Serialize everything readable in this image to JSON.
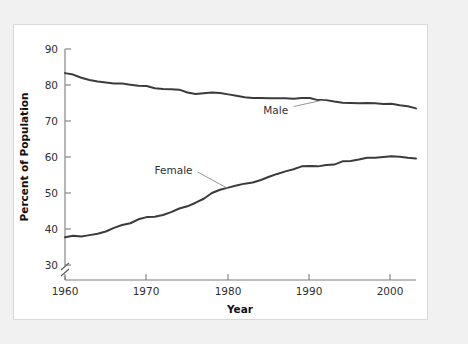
{
  "chart_data": {
    "type": "line",
    "title": "",
    "xlabel": "Year",
    "ylabel": "Percent of Population",
    "xlim": [
      1960,
      2003
    ],
    "ylim": [
      30,
      90
    ],
    "y_axis_break": true,
    "grid": false,
    "legend_position": "inline-annotation",
    "xticks": [
      1960,
      1970,
      1980,
      1990,
      2000
    ],
    "xtick_labels": [
      "1960",
      "1970",
      "1980",
      "1990",
      "2000"
    ],
    "yticks": [
      30,
      40,
      50,
      60,
      70,
      80,
      90
    ],
    "ytick_labels": [
      "30",
      "40",
      "50",
      "60",
      "70",
      "80",
      "90"
    ],
    "x": [
      1960,
      1961,
      1962,
      1963,
      1964,
      1965,
      1966,
      1967,
      1968,
      1969,
      1970,
      1971,
      1972,
      1973,
      1974,
      1975,
      1976,
      1977,
      1978,
      1979,
      1980,
      1981,
      1982,
      1983,
      1984,
      1985,
      1986,
      1987,
      1988,
      1989,
      1990,
      1991,
      1992,
      1993,
      1994,
      1995,
      1996,
      1997,
      1998,
      1999,
      2000,
      2001,
      2002,
      2003
    ],
    "series": [
      {
        "name": "Male",
        "label": "Male",
        "color": "#3b3b3b",
        "values": [
          83.3,
          82.9,
          82.0,
          81.4,
          81.0,
          80.7,
          80.4,
          80.4,
          80.1,
          79.8,
          79.7,
          79.1,
          78.9,
          78.8,
          78.7,
          77.9,
          77.5,
          77.7,
          77.9,
          77.8,
          77.4,
          77.0,
          76.6,
          76.4,
          76.4,
          76.3,
          76.3,
          76.3,
          76.2,
          76.4,
          76.4,
          75.8,
          75.8,
          75.4,
          75.1,
          75.0,
          74.9,
          75.0,
          74.9,
          74.7,
          74.8,
          74.4,
          74.1,
          73.5
        ]
      },
      {
        "name": "Female",
        "label": "Female",
        "color": "#3b3b3b",
        "values": [
          37.7,
          38.1,
          37.9,
          38.3,
          38.7,
          39.3,
          40.3,
          41.1,
          41.6,
          42.7,
          43.3,
          43.4,
          43.9,
          44.7,
          45.7,
          46.3,
          47.3,
          48.4,
          50.0,
          50.9,
          51.5,
          52.1,
          52.6,
          52.9,
          53.6,
          54.5,
          55.3,
          56.0,
          56.6,
          57.4,
          57.5,
          57.4,
          57.8,
          57.9,
          58.8,
          58.9,
          59.3,
          59.8,
          59.8,
          60.0,
          60.2,
          60.1,
          59.8,
          59.6
        ]
      }
    ],
    "annotations": [
      {
        "text": "Male",
        "x": 1989,
        "y": 73.2
      },
      {
        "text": "Female",
        "x": 1976,
        "y": 56.4
      }
    ]
  },
  "figure": {
    "background_color": "#f1f1f1",
    "panel_color": "#ffffff",
    "line_color": "#3b3b3b",
    "axis_color": "#7c7c7c"
  }
}
